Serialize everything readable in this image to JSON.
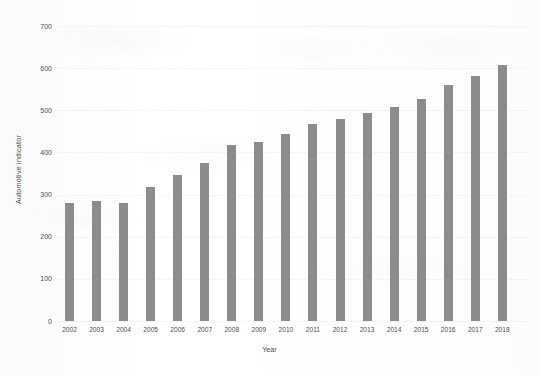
{
  "chart_data": {
    "type": "bar",
    "title": "",
    "xlabel": "Year",
    "ylabel": "Automotive indicator",
    "categories": [
      "2002",
      "2003",
      "2004",
      "2005",
      "2006",
      "2007",
      "2008",
      "2009",
      "2010",
      "2011",
      "2012",
      "2013",
      "2014",
      "2015",
      "2016",
      "2017",
      "2018"
    ],
    "values": [
      280,
      285,
      280,
      318,
      346,
      375,
      418,
      425,
      444,
      468,
      479,
      494,
      508,
      527,
      560,
      581,
      608
    ],
    "ylim": [
      0,
      700
    ],
    "yticks": [
      "0",
      "100",
      "200",
      "300",
      "400",
      "500",
      "600",
      "700"
    ],
    "grid": true,
    "legend": false,
    "bar_color": "#8c8c8c",
    "background_color": "#fdfdfd",
    "text_color": "#4e4e4e"
  }
}
